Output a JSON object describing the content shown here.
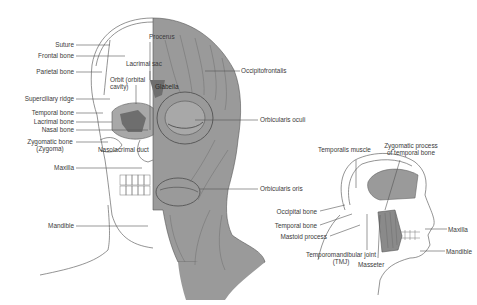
{
  "diagram": {
    "type": "anatomy-illustration",
    "colors": {
      "muscle_fill": "#9a9a9a",
      "muscle_dark": "#6e6e6e",
      "line": "#555555",
      "text": "#3a3a3a",
      "background": "#ffffff"
    },
    "front_view": {
      "left_labels": [
        {
          "id": "suture",
          "text": "Suture"
        },
        {
          "id": "frontal-bone",
          "text": "Frontal bone"
        },
        {
          "id": "parietal-bone",
          "text": "Parietal bone"
        },
        {
          "id": "superciliary-ridge",
          "text": "Superciliary ridge"
        },
        {
          "id": "temporal-bone",
          "text": "Temporal bone"
        },
        {
          "id": "lacrimal-bone",
          "text": "Lacrimal bone"
        },
        {
          "id": "nasal-bone",
          "text": "Nasal bone"
        },
        {
          "id": "zygomatic-bone",
          "text": "Zygomatic bone",
          "text2": "(Zygoma)"
        },
        {
          "id": "maxilla",
          "text": "Maxilla"
        },
        {
          "id": "mandible",
          "text": "Mandible"
        }
      ],
      "inner_labels": [
        {
          "id": "procerus",
          "text": "Procerus"
        },
        {
          "id": "lacrimal-sac",
          "text": "Lacrimal sac"
        },
        {
          "id": "orbit",
          "text": "Orbit (orbital",
          "text2": "cavity)"
        },
        {
          "id": "glabella",
          "text": "Glabella"
        },
        {
          "id": "nasolacrimal-duct",
          "text": "Nasolacrimal duct"
        }
      ],
      "right_labels": [
        {
          "id": "occipitofrontalis",
          "text": "Occipitofrontalis"
        },
        {
          "id": "orbicularis-oculi",
          "text": "Orbicularis oculi"
        },
        {
          "id": "orbicularis-oris",
          "text": "Orbicularis oris"
        }
      ]
    },
    "side_view": {
      "top_labels": [
        {
          "id": "temporalis-muscle",
          "text": "Temporalis muscle"
        },
        {
          "id": "zygomatic-process",
          "text": "Zygomatic process",
          "text2": "of temporal bone"
        }
      ],
      "left_labels": [
        {
          "id": "occipital-bone",
          "text": "Occipital bone"
        },
        {
          "id": "temporal-bone-side",
          "text": "Temporal bone"
        },
        {
          "id": "mastoid-process",
          "text": "Mastoid process"
        }
      ],
      "bottom_labels": [
        {
          "id": "tmj",
          "text": "Temporomandibular joint",
          "text2": "(TMJ)"
        },
        {
          "id": "masseter",
          "text": "Masseter"
        }
      ],
      "right_labels": [
        {
          "id": "maxilla-side",
          "text": "Maxilla"
        },
        {
          "id": "mandible-side",
          "text": "Mandible"
        }
      ]
    }
  }
}
